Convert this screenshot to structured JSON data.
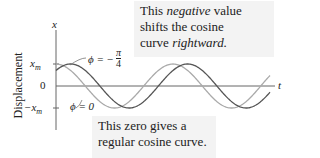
{
  "annotations": {
    "top": {
      "line1_pre": "This ",
      "line1_em": "negative",
      "line1_post": " value",
      "line2": "shifts the cosine",
      "line3_pre": "curve ",
      "line3_em": "rightward."
    },
    "bottom": {
      "line1": "This zero gives a",
      "line2": "regular cosine curve."
    }
  },
  "axes": {
    "y_axis_label": "x",
    "x_axis_label": "t",
    "side_label": "Displacement",
    "ticks": {
      "xm": "x",
      "xm_sub": "m",
      "zero": "0",
      "neg_xm": "−x",
      "neg_xm_sub": "m"
    }
  },
  "curve_labels": {
    "shifted": "ϕ = −",
    "shifted_num": "π",
    "shifted_den": "4",
    "regular": "ϕ = 0"
  },
  "colors": {
    "shifted_curve": "#555555",
    "regular_curve": "#aaaaaa",
    "box_bg": "#f3f3f3"
  },
  "chart_data": {
    "type": "line",
    "title": "",
    "xlabel": "t",
    "ylabel": "Displacement x",
    "series": [
      {
        "name": "ϕ = 0",
        "function": "x_m cos(ωt)"
      },
      {
        "name": "ϕ = −π/4",
        "function": "x_m cos(ωt − π/4)"
      }
    ],
    "y_ticks": [
      "x_m",
      "0",
      "−x_m"
    ]
  }
}
